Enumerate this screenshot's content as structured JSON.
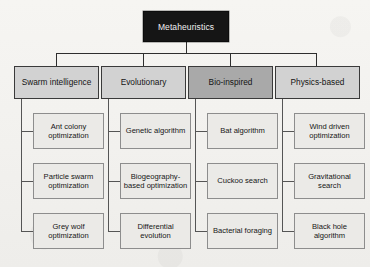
{
  "diagram": {
    "root": {
      "label": "Metaheuristics"
    },
    "colors": {
      "root_fill": "#151515",
      "root_text": "#f0f0f0",
      "category_fill": "#d2d2d2",
      "category_fill_highlight": "#a9a9a9",
      "leaf_fill": "#ebeae7",
      "border": "#3a3a3a",
      "leaf_border": "#8d8d8d",
      "background": "#f4f3f0"
    },
    "categories": [
      {
        "label": "Swarm intelligence",
        "highlighted": false,
        "children": [
          {
            "label": "Ant colony optimization"
          },
          {
            "label": "Particle swarm optimization"
          },
          {
            "label": "Grey wolf optimization"
          }
        ]
      },
      {
        "label": "Evolutionary",
        "highlighted": false,
        "children": [
          {
            "label": "Genetic algorithm"
          },
          {
            "label": "Biogeography-based optimization"
          },
          {
            "label": "Differential evolution"
          }
        ]
      },
      {
        "label": "Bio-inspired",
        "highlighted": true,
        "children": [
          {
            "label": "Bat algorithm"
          },
          {
            "label": "Cuckoo search"
          },
          {
            "label": "Bacterial foraging"
          }
        ]
      },
      {
        "label": "Physics-based",
        "highlighted": false,
        "children": [
          {
            "label": "Wind driven optimization"
          },
          {
            "label": "Gravitational search"
          },
          {
            "label": "Black hole algorithm"
          }
        ]
      }
    ]
  }
}
